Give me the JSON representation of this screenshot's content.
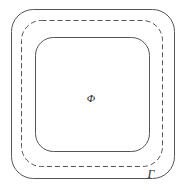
{
  "figure": {
    "background_color": "#ffffff",
    "width": 186,
    "height": 190,
    "labels": {
      "interior_region": "Φ",
      "boundary_curve": "Γ"
    },
    "shapes": {
      "outer_boundary": {
        "name": "outer-solid-rounded-rectangle",
        "stroke_style": "solid",
        "stroke_color": "#555555",
        "stroke_width": 1,
        "fill": "none",
        "x": 11,
        "y": 9,
        "width": 164,
        "height": 170,
        "corner_radius": 22
      },
      "middle_boundary": {
        "name": "middle-dashed-rounded-rectangle",
        "stroke_style": "dashed",
        "stroke_color": "#555555",
        "stroke_width": 1,
        "dash_length": 5,
        "dash_gap": 3,
        "fill": "none",
        "x": 21,
        "y": 20,
        "width": 142,
        "height": 147,
        "corner_radius": 20
      },
      "inner_boundary": {
        "name": "inner-solid-rounded-rectangle",
        "stroke_style": "solid",
        "stroke_color": "#555555",
        "stroke_width": 1,
        "fill": "none",
        "x": 35,
        "y": 37,
        "width": 115,
        "height": 115,
        "corner_radius": 18
      }
    },
    "label_positions": {
      "interior_region": {
        "x": 91,
        "y": 99
      },
      "boundary_curve": {
        "x": 151,
        "y": 178
      }
    }
  }
}
